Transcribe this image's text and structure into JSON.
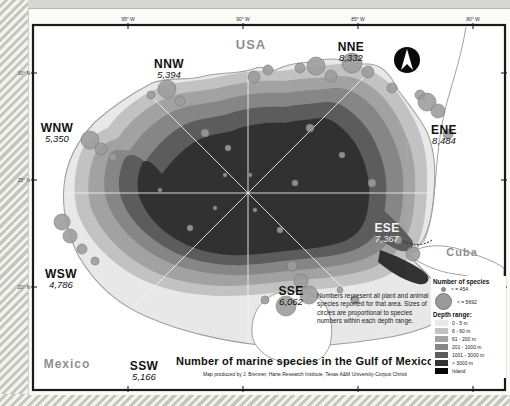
{
  "map": {
    "title": "Number of marine species in the Gulf of Mexico",
    "credit": "Map produced by J. Brenner, Harte Research Institute, Texas A&M University-Corpus Christi",
    "note": "Numbers represent all plant and animal species reported for that area. Sizes of circles are proportional to species numbers within each depth range.",
    "countries": [
      {
        "name": "USA",
        "x": 251,
        "y": 44,
        "size": 13
      },
      {
        "name": "Mexico",
        "x": 67,
        "y": 364,
        "size": 12
      },
      {
        "name": "Cuba",
        "x": 462,
        "y": 252,
        "size": 11
      }
    ],
    "sectors": [
      {
        "dir": "NNW",
        "value": "5,394",
        "x": 169,
        "y": 69,
        "color": "#111111"
      },
      {
        "dir": "NNE",
        "value": "8,332",
        "x": 351,
        "y": 52,
        "color": "#111111"
      },
      {
        "dir": "WNW",
        "value": "5,350",
        "x": 57,
        "y": 133,
        "color": "#111111"
      },
      {
        "dir": "ENE",
        "value": "8,484",
        "x": 444,
        "y": 135,
        "color": "#111111"
      },
      {
        "dir": "ESE",
        "value": "7,367",
        "x": 387,
        "y": 233,
        "color": "#f4f4f4"
      },
      {
        "dir": "WSW",
        "value": "4,786",
        "x": 61,
        "y": 279,
        "color": "#111111"
      },
      {
        "dir": "SSW",
        "value": "5,166",
        "x": 144,
        "y": 371,
        "color": "#111111"
      },
      {
        "dir": "SSE",
        "value": "6,062",
        "x": 291,
        "y": 296,
        "color": "#111111"
      }
    ],
    "graticule": {
      "lon": [
        {
          "label": "95° W",
          "x": 128
        },
        {
          "label": "90° W",
          "x": 243
        },
        {
          "label": "85° W",
          "x": 358
        },
        {
          "label": "80° W",
          "x": 473
        }
      ],
      "lat": [
        {
          "label": "30° N",
          "y": 73
        },
        {
          "label": "25° N",
          "y": 180
        },
        {
          "label": "20° N",
          "y": 287
        }
      ]
    },
    "legend": {
      "species": {
        "title": "Number of species",
        "min_label": "> = 454",
        "max_label": "< = 5692"
      },
      "depth": {
        "title": "Depth range:",
        "items": [
          {
            "label": "0 - 5 m",
            "color": "#e8e8e8"
          },
          {
            "label": "6 - 60 m",
            "color": "#c2c2c2"
          },
          {
            "label": "61 - 200 m",
            "color": "#a4a4a4"
          },
          {
            "label": "201 - 1000 m",
            "color": "#868686"
          },
          {
            "label": "1001 - 3000 m",
            "color": "#5c5c5c"
          },
          {
            "label": "> 3000 m",
            "color": "#333333"
          },
          {
            "label": "Island",
            "color": "#050505"
          }
        ]
      }
    },
    "graphics": {
      "frame": {
        "x": 33,
        "y": 25,
        "w": 472,
        "h": 365,
        "stroke": "#1a1a1a"
      },
      "center": {
        "x": 248,
        "y": 193
      },
      "coast_color": "#a0a0a0",
      "gulf_outline": "M 95,122 C 115,104 135,92 152,83 C 170,76 185,81 200,77 C 222,71 240,75 256,68 C 263,64 268,74 278,69 C 292,61 308,64 322,60 C 338,56 352,65 368,64 C 382,64 392,77 398,90 C 407,102 419,116 427,132 C 434,148 436,170 434,192 C 433,210 430,226 424,238 C 418,248 410,254 415,262 C 425,272 435,280 440,295 C 443,308 442,318 438,322 C 420,331 400,336 378,339 C 340,345 300,349 260,345 C 222,341 180,331 150,318 C 120,306 95,285 78,255 C 66,230 62,206 64,186 C 66,162 78,140 95,122 Z",
      "rings": [
        {
          "color": "#c2c2c2",
          "d": "M 108,128 C 120,110 140,96 158,88 C 178,80 200,82 222,76 C 244,71 262,70 282,71 C 300,68 318,66 338,64 C 356,63 374,70 388,82 C 400,94 410,110 418,128 C 426,146 428,168 427,190 C 426,212 424,232 416,248 C 408,262 396,272 382,278 C 360,286 330,288 305,290 C 280,292 250,296 225,296 C 195,296 160,290 135,276 C 110,262 88,240 78,214 C 72,194 74,168 82,150 C 88,138 98,132 108,128 Z"
        },
        {
          "color": "#a4a4a4",
          "d": "M 118,138 C 130,120 148,106 166,98 C 186,90 206,92 226,86 C 248,81 266,80 284,81 C 302,78 320,78 338,76 C 354,75 368,82 380,94 C 392,106 400,120 407,138 C 414,156 416,172 415,192 C 414,212 412,228 404,242 C 396,254 386,262 372,268 C 350,276 324,278 300,280 C 276,282 250,286 226,286 C 198,286 166,280 143,266 C 120,252 100,232 91,208 C 86,190 88,170 95,154 C 101,144 108,142 118,138 Z"
        },
        {
          "color": "#868686",
          "d": "M 130,150 C 142,132 158,118 176,110 C 194,103 212,104 230,98 C 250,93 268,92 286,93 C 302,90 318,90 334,88 C 348,87 360,94 371,105 C 382,116 390,130 396,146 C 402,162 404,176 403,194 C 402,212 400,224 393,236 C 386,247 377,254 364,259 C 344,266 320,268 298,270 C 276,272 252,276 230,275 C 204,274 175,268 154,255 C 133,242 115,224 107,202 C 102,186 104,168 110,154 C 116,146 122,152 130,150 Z"
        },
        {
          "color": "#5c5c5c",
          "d": "M 145,162 C 156,146 170,132 186,124 C 202,117 218,118 234,112 C 252,107 268,106 284,107 C 298,104 312,104 326,102 C 338,101 348,108 358,118 C 368,128 375,140 380,154 C 385,168 387,180 386,196 C 385,212 383,222 377,232 C 371,241 363,247 351,251 C 333,257 312,258 292,260 C 272,262 250,266 230,265 C 206,264 182,258 163,246 C 144,234 128,218 121,198 C 117,184 119,170 125,158 C 131,152 138,156 145,162 Z"
        },
        {
          "color": "#5c5c5c",
          "d": "M 370,200 C 385,210 400,225 412,240 C 416,248 408,254 398,250 C 384,244 372,234 366,224 Z"
        },
        {
          "color": "#333333",
          "d": "M 162,174 C 172,160 184,148 198,140 C 212,133 226,134 240,128 C 256,123 270,122 284,123 C 296,120 308,120 320,118 C 330,117 338,124 346,132 C 354,140 360,150 364,162 C 368,174 370,184 369,198 C 368,212 366,220 361,228 C 356,235 349,240 339,243 C 323,248 304,249 286,251 C 268,253 248,256 230,255 C 210,254 190,248 174,238 C 158,228 145,214 139,196 C 136,184 138,172 143,162 C 149,158 155,166 162,174 Z"
        },
        {
          "color": "#333333",
          "d": "M 380,250 C 395,255 410,262 425,272 C 432,278 428,286 418,284 C 402,280 388,270 378,262 Z"
        }
      ],
      "land_patches": [
        {
          "d": "M 252,330 C 252,312 262,298 278,293 C 296,289 314,293 323,302 C 331,312 333,326 331,340 C 329,352 322,360 312,362 C 295,366 270,362 260,350 C 254,344 252,338 252,330 Z"
        },
        {
          "d": "M 412,252 C 425,244 444,244 462,250 C 480,256 496,262 504,268 L 504,290 C 492,282 472,276 455,274 C 438,272 422,264 412,258 Z"
        }
      ],
      "coast_lines": [
        {
          "d": "M 466,27 C 462,52 454,78 447,102 C 440,128 437,158 435,186 C 433,210 429,232 423,243"
        },
        {
          "d": "M 400,240 C 412,246 424,246 432,240"
        }
      ],
      "bubble_fill": "#9c9c9c",
      "bubble_stroke": "#787878",
      "bubbles": [
        {
          "x": 167,
          "y": 89,
          "r": 9
        },
        {
          "x": 180,
          "y": 101,
          "r": 5
        },
        {
          "x": 151,
          "y": 95,
          "r": 4
        },
        {
          "x": 90,
          "y": 140,
          "r": 9
        },
        {
          "x": 101,
          "y": 149,
          "r": 6
        },
        {
          "x": 113,
          "y": 157,
          "r": 4
        },
        {
          "x": 254,
          "y": 77,
          "r": 6
        },
        {
          "x": 268,
          "y": 70,
          "r": 5
        },
        {
          "x": 300,
          "y": 68,
          "r": 5
        },
        {
          "x": 316,
          "y": 66,
          "r": 9
        },
        {
          "x": 331,
          "y": 76,
          "r": 6
        },
        {
          "x": 352,
          "y": 63,
          "r": 10
        },
        {
          "x": 368,
          "y": 72,
          "r": 6
        },
        {
          "x": 392,
          "y": 88,
          "r": 5
        },
        {
          "x": 420,
          "y": 95,
          "r": 5
        },
        {
          "x": 427,
          "y": 102,
          "r": 9
        },
        {
          "x": 438,
          "y": 111,
          "r": 7
        },
        {
          "x": 448,
          "y": 134,
          "r": 5
        },
        {
          "x": 205,
          "y": 133,
          "r": 4
        },
        {
          "x": 228,
          "y": 148,
          "r": 3
        },
        {
          "x": 310,
          "y": 128,
          "r": 4
        },
        {
          "x": 342,
          "y": 155,
          "r": 3
        },
        {
          "x": 372,
          "y": 183,
          "r": 4
        },
        {
          "x": 295,
          "y": 183,
          "r": 3
        },
        {
          "x": 250,
          "y": 175,
          "r": 2
        },
        {
          "x": 215,
          "y": 208,
          "r": 2
        },
        {
          "x": 190,
          "y": 228,
          "r": 3
        },
        {
          "x": 255,
          "y": 210,
          "r": 2
        },
        {
          "x": 280,
          "y": 230,
          "r": 3
        },
        {
          "x": 225,
          "y": 175,
          "r": 2
        },
        {
          "x": 160,
          "y": 190,
          "r": 2
        },
        {
          "x": 62,
          "y": 222,
          "r": 8
        },
        {
          "x": 70,
          "y": 236,
          "r": 7
        },
        {
          "x": 82,
          "y": 249,
          "r": 5
        },
        {
          "x": 95,
          "y": 261,
          "r": 4
        },
        {
          "x": 292,
          "y": 266,
          "r": 5
        },
        {
          "x": 301,
          "y": 281,
          "r": 7
        },
        {
          "x": 309,
          "y": 295,
          "r": 9
        },
        {
          "x": 286,
          "y": 306,
          "r": 10
        },
        {
          "x": 265,
          "y": 300,
          "r": 4
        },
        {
          "x": 413,
          "y": 254,
          "r": 7
        },
        {
          "x": 398,
          "y": 240,
          "r": 4
        },
        {
          "x": 355,
          "y": 300,
          "r": 4
        },
        {
          "x": 340,
          "y": 290,
          "r": 3
        }
      ],
      "compass": {
        "x": 407,
        "y": 60,
        "r": 13
      }
    }
  }
}
